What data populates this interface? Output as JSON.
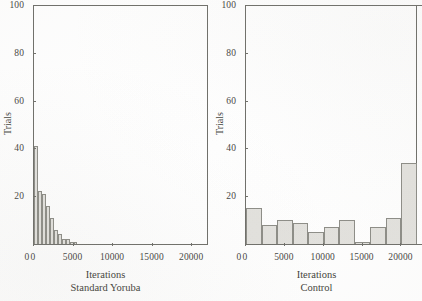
{
  "figure": {
    "background": "#ffffff",
    "ink_color": "#46463f",
    "bar_fill": "#e3e2de",
    "bar_stroke": "#8d8d87"
  },
  "panels": [
    {
      "key": "standard-yoruba",
      "caption_line1": "Iterations",
      "caption_line2": "Standard Yoruba",
      "ylabel": "Trials",
      "yticks": [
        "100",
        "80",
        "60",
        "40",
        "20"
      ],
      "xticks": [
        "0",
        "0",
        "5000",
        "10000",
        "15000",
        "20000"
      ]
    },
    {
      "key": "control",
      "caption_line1": "Iterations",
      "caption_line2": "Control",
      "ylabel": "Trials",
      "yticks": [
        "100",
        "80",
        "60",
        "40",
        "20"
      ],
      "xticks": [
        "0",
        "0",
        "5000",
        "10000",
        "15000",
        "20000"
      ]
    }
  ],
  "chart_data": [
    {
      "type": "bar",
      "title": "Standard Yoruba",
      "subtitle": "",
      "xlabel": "Iterations",
      "ylabel": "Trials",
      "xlim": [
        0,
        22000
      ],
      "ylim": [
        0,
        100
      ],
      "xticks": [
        0,
        5000,
        10000,
        15000,
        20000
      ],
      "yticks": [
        0,
        20,
        40,
        60,
        80,
        100
      ],
      "grid": false,
      "legend": null,
      "bin_width": 500,
      "bin_starts": [
        0,
        500,
        1000,
        1500,
        2000,
        2500,
        3000,
        3500,
        4000,
        4500,
        5000,
        5500,
        6000
      ],
      "values": [
        41,
        22,
        21,
        16,
        11,
        6,
        4,
        2,
        2,
        1,
        1,
        0,
        0
      ]
    },
    {
      "type": "bar",
      "title": "Control",
      "subtitle": "",
      "xlabel": "Iterations",
      "ylabel": "Trials",
      "xlim": [
        0,
        22000
      ],
      "ylim": [
        0,
        100
      ],
      "xticks": [
        0,
        5000,
        10000,
        15000,
        20000
      ],
      "yticks": [
        0,
        20,
        40,
        60,
        80,
        100
      ],
      "grid": false,
      "legend": null,
      "bin_width": 2000,
      "bin_starts": [
        0,
        2000,
        4000,
        6000,
        8000,
        10000,
        12000,
        14000,
        16000,
        18000,
        20000
      ],
      "values": [
        15,
        8,
        10,
        9,
        5,
        7,
        10,
        1,
        7,
        11,
        34
      ]
    }
  ]
}
